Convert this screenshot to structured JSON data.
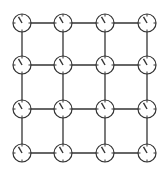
{
  "diagram": {
    "type": "grid-graph",
    "rows": 4,
    "cols": 4,
    "node_icon": "clock-icon",
    "node_radius": 9,
    "col_x": [
      22,
      63,
      105,
      147
    ],
    "row_y": [
      23,
      65,
      109,
      153
    ],
    "edge_color": "#333333",
    "node_stroke": "#333333",
    "node_fill": "#ffffff",
    "hand_angle_deg": -30,
    "edges": "orthogonal neighbors (4-connected lattice)"
  }
}
